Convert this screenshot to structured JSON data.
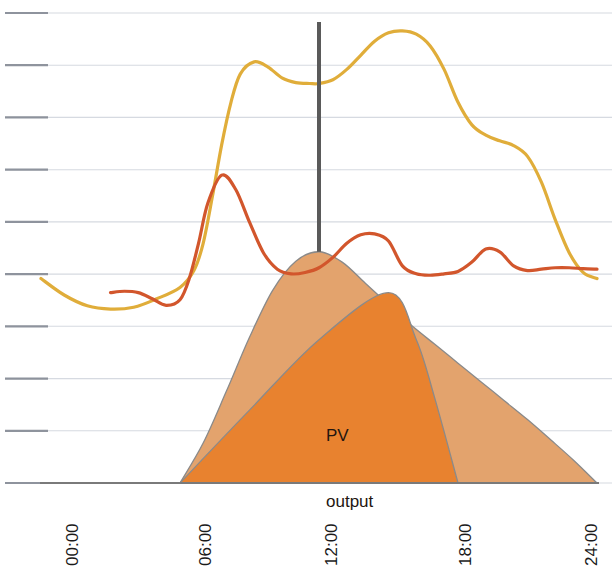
{
  "chart_data": {
    "type": "area",
    "title": "",
    "subtitle": "",
    "xlabel": "",
    "ylabel": "",
    "grid": true,
    "grid_lines": 10,
    "legend_position": "inline-annotation",
    "xlim": [
      0,
      24
    ],
    "xtick_labels": [
      "00:00",
      "06:00",
      "12:00",
      "18:00",
      "24:00"
    ],
    "xtick_values": [
      0,
      6,
      12,
      18,
      24
    ],
    "ylim": [
      0,
      10
    ],
    "ytick_labels": [],
    "annotations": [
      {
        "text": "PV\noutput",
        "x": 12.6,
        "y": 3.0
      }
    ],
    "markers": [
      {
        "name": "noon-marker",
        "type": "vline",
        "x": 12,
        "color": "#5a5a5a"
      }
    ],
    "series": [
      {
        "name": "load-curve-yellow",
        "type": "line",
        "color": "#e0ad3a",
        "x": [
          0.0,
          1.0,
          2.0,
          3.0,
          4.0,
          5.0,
          6.0,
          6.6,
          7.0,
          7.4,
          7.8,
          8.2,
          8.6,
          9.2,
          9.8,
          10.4,
          11.0,
          11.6,
          12.0,
          12.6,
          13.2,
          13.8,
          14.4,
          15.0,
          15.6,
          16.2,
          16.8,
          17.4,
          18.0,
          18.6,
          19.2,
          19.8,
          20.4,
          21.0,
          21.6,
          22.2,
          22.8,
          23.4,
          24.0
        ],
        "values": [
          4.35,
          4.0,
          3.77,
          3.7,
          3.74,
          3.92,
          4.16,
          4.52,
          5.1,
          6.1,
          7.2,
          8.1,
          8.7,
          8.96,
          8.85,
          8.62,
          8.52,
          8.5,
          8.5,
          8.58,
          8.8,
          9.1,
          9.4,
          9.58,
          9.62,
          9.55,
          9.3,
          8.8,
          8.1,
          7.62,
          7.4,
          7.28,
          7.18,
          6.95,
          6.4,
          5.6,
          4.9,
          4.48,
          4.35
        ]
      },
      {
        "name": "residual-load-curve-red",
        "type": "line",
        "color": "#d2562c",
        "x": [
          3.0,
          3.6,
          4.2,
          4.8,
          5.4,
          6.0,
          6.4,
          6.8,
          7.2,
          7.8,
          8.4,
          9.0,
          9.6,
          10.2,
          10.8,
          11.4,
          12.0,
          12.6,
          13.2,
          13.8,
          14.4,
          15.0,
          15.6,
          16.2,
          16.8,
          17.4,
          18.0,
          18.6,
          19.2,
          19.8,
          20.4,
          21.0,
          21.6,
          22.2,
          22.8,
          23.4,
          24.0
        ],
        "values": [
          4.05,
          4.08,
          4.05,
          3.92,
          3.78,
          3.9,
          4.35,
          5.1,
          5.95,
          6.55,
          6.25,
          5.55,
          4.9,
          4.55,
          4.45,
          4.48,
          4.58,
          4.8,
          5.1,
          5.28,
          5.3,
          5.15,
          4.62,
          4.45,
          4.42,
          4.45,
          4.5,
          4.7,
          4.98,
          4.92,
          4.62,
          4.52,
          4.55,
          4.58,
          4.58,
          4.56,
          4.55
        ]
      },
      {
        "name": "pv-potential-outer-area",
        "type": "area",
        "color": "#e3a36d",
        "x": [
          6.0,
          7.0,
          8.0,
          9.0,
          10.0,
          11.0,
          12.0,
          13.0,
          14.0,
          15.0,
          16.0,
          17.0,
          18.0,
          19.0,
          20.0,
          21.0,
          22.0,
          23.0,
          24.0
        ],
        "values": [
          0.0,
          0.85,
          1.95,
          3.1,
          4.1,
          4.72,
          4.92,
          4.7,
          4.25,
          3.8,
          3.35,
          2.95,
          2.55,
          2.15,
          1.75,
          1.35,
          0.92,
          0.48,
          0.0
        ]
      },
      {
        "name": "pv-output-inner-area",
        "type": "area",
        "color": "#e8822f",
        "x": [
          6.0,
          9.0,
          12.0,
          15.0,
          16.2,
          17.0,
          18.0
        ],
        "values": [
          0.0,
          1.55,
          3.05,
          4.05,
          3.05,
          1.8,
          0.0
        ]
      }
    ]
  },
  "axis": {
    "baseline_color": "#7a7a7a",
    "gridline_color": "#c7ccd6",
    "tick_color": "#8a8f99"
  },
  "colors": {
    "yellow_line": "#e0ad3a",
    "red_line": "#d2562c",
    "pv_light": "#e3a36d",
    "pv_dark": "#e8822f",
    "marker": "#5a5a5a",
    "annotation_text": "#231510",
    "tick_label": "#1a1a1a"
  },
  "xticks": [
    {
      "label": "00:00",
      "px": 63
    },
    {
      "label": "06:00",
      "px": 196
    },
    {
      "label": "12:00",
      "px": 322
    },
    {
      "label": "18:00",
      "px": 456
    },
    {
      "label": "24:00",
      "px": 582
    }
  ],
  "annotation": {
    "line1": "PV",
    "line2": "output"
  }
}
